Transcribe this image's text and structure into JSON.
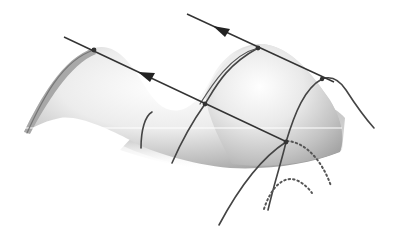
{
  "figure": {
    "colors": {
      "background": "#ffffff",
      "surface_light": "#f4f4f4",
      "surface_mid": "#c8c8c8",
      "surface_dark": "#9a9a9a",
      "line": "#3a3a3a",
      "dotted": "#555555",
      "scanline": "#ffffff"
    },
    "elements": {
      "peak_left": {
        "x": 94,
        "y": 50
      },
      "peak_right": {
        "x": 258,
        "y": 48
      },
      "saddle_point": {
        "x": 205,
        "y": 104
      },
      "lower_node": {
        "x": 286,
        "y": 142
      },
      "right_node": {
        "x": 322,
        "y": 79
      },
      "arrow_upper": {
        "x": 222,
        "y": 31,
        "direction": "up-left"
      },
      "arrow_lower": {
        "x": 147,
        "y": 76,
        "direction": "up-left"
      }
    }
  }
}
